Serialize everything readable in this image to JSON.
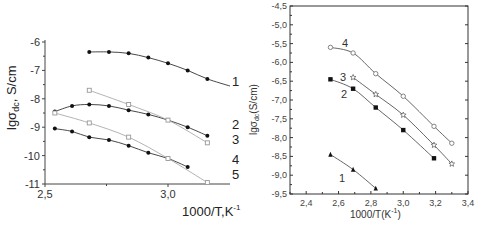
{
  "chart_data": [
    {
      "type": "line",
      "title": "",
      "xlabel": "1000/T,K-1",
      "ylabel": "lgσdc, S/cm",
      "xlim": [
        2.5,
        3.25
      ],
      "ylim": [
        -11,
        -6
      ],
      "x_ticks": [
        "2,5",
        "3,0"
      ],
      "y_ticks": [
        "-6",
        "-7",
        "-8",
        "-9",
        "-10",
        "-11"
      ],
      "grid": false,
      "legend": "curve numbers at right end",
      "series": [
        {
          "name": "1",
          "marker": "filled-circle",
          "x": [
            2.68,
            2.76,
            2.84,
            2.92,
            3.0,
            3.08,
            3.16
          ],
          "y": [
            -6.35,
            -6.35,
            -6.4,
            -6.55,
            -6.75,
            -7.0,
            -7.3
          ]
        },
        {
          "name": "2",
          "marker": "filled-circle",
          "x": [
            2.54,
            2.61,
            2.68,
            2.76,
            2.84,
            2.92,
            3.0,
            3.08,
            3.16
          ],
          "y": [
            -8.45,
            -8.25,
            -8.2,
            -8.25,
            -8.4,
            -8.55,
            -8.75,
            -9.0,
            -9.3
          ]
        },
        {
          "name": "3",
          "marker": "open-square",
          "x": [
            2.68,
            2.84,
            3.0,
            3.16
          ],
          "y": [
            -7.7,
            -8.2,
            -8.75,
            -9.55
          ]
        },
        {
          "name": "4",
          "marker": "filled-circle",
          "x": [
            2.54,
            2.61,
            2.68,
            2.76,
            2.84,
            2.92,
            3.0,
            3.08
          ],
          "y": [
            -9.05,
            -9.15,
            -9.35,
            -9.45,
            -9.65,
            -9.9,
            -10.1,
            -10.4
          ]
        },
        {
          "name": "5",
          "marker": "open-square",
          "x": [
            2.54,
            2.68,
            2.84,
            3.0,
            3.16
          ],
          "y": [
            -8.5,
            -8.85,
            -9.35,
            -10.1,
            -10.95
          ]
        }
      ]
    },
    {
      "type": "line",
      "title": "",
      "xlabel": "1000/T(K-1)",
      "ylabel": "lgσdc(S/cm)",
      "xlim": [
        2.3,
        3.4
      ],
      "ylim": [
        -9.5,
        -4.5
      ],
      "x_ticks": [
        "2,4",
        "2,6",
        "2,8",
        "3,0",
        "3,2",
        "3,4"
      ],
      "y_ticks": [
        "-4,5",
        "-5,0",
        "-5,5",
        "-6,0",
        "-6,5",
        "-7,0",
        "-7,5",
        "-8,0",
        "-8,5",
        "-9,0",
        "-9,5"
      ],
      "grid": false,
      "legend": "curve numbers near start",
      "series": [
        {
          "name": "1",
          "marker": "filled-triangle",
          "x": [
            2.55,
            2.69,
            2.83
          ],
          "y": [
            -8.45,
            -8.85,
            -9.35
          ]
        },
        {
          "name": "2",
          "marker": "filled-square",
          "x": [
            2.55,
            2.69,
            2.83,
            3.0,
            3.19
          ],
          "y": [
            -6.45,
            -6.7,
            -7.2,
            -7.8,
            -8.55
          ]
        },
        {
          "name": "3",
          "marker": "star",
          "x": [
            2.69,
            2.83,
            3.0,
            3.19,
            3.3
          ],
          "y": [
            -6.4,
            -6.85,
            -7.4,
            -8.2,
            -8.7
          ]
        },
        {
          "name": "4",
          "marker": "open-circle",
          "x": [
            2.55,
            2.69,
            2.83,
            3.0,
            3.19,
            3.3
          ],
          "y": [
            -5.6,
            -5.75,
            -6.3,
            -6.9,
            -7.7,
            -8.15
          ]
        }
      ]
    }
  ],
  "left": {
    "ylabel_main": "lgσ",
    "ylabel_sub": "dc",
    "ylabel_rest": ", S/cm",
    "xlabel_main": "1000/T,K",
    "xlabel_sup": "-1",
    "y_ticks": [
      "-6",
      "-7",
      "-8",
      "-9",
      "-10",
      "-11"
    ],
    "x_ticks": [
      "2,5",
      "3,0"
    ],
    "curve_labels": [
      "1",
      "2",
      "3",
      "4",
      "5"
    ]
  },
  "right": {
    "ylabel_main": "lgσ",
    "ylabel_sub": "dc",
    "ylabel_rest": "(S/cm)",
    "xlabel_main": "1000/T(K",
    "xlabel_sup": "-1",
    "xlabel_end": ")",
    "y_ticks": [
      "-4,5",
      "-5,0",
      "-5,5",
      "-6,0",
      "-6,5",
      "-7,0",
      "-7,5",
      "-8,0",
      "-8,5",
      "-9,0",
      "-9,5"
    ],
    "x_ticks": [
      "2,4",
      "2,6",
      "2,8",
      "3,0",
      "3,2",
      "3,4"
    ],
    "curve_labels": [
      "1",
      "2",
      "3",
      "4"
    ]
  }
}
